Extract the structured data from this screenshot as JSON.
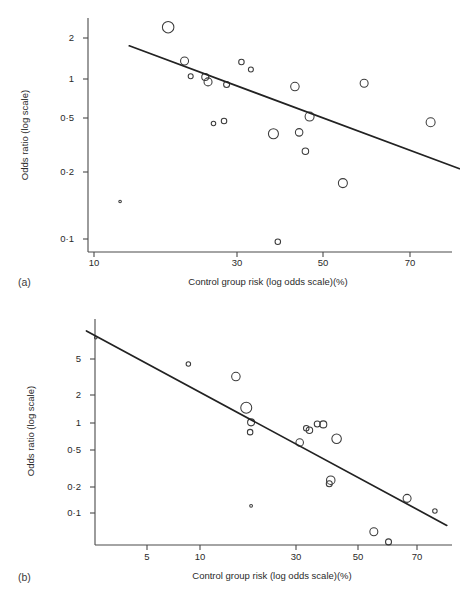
{
  "figure": {
    "panels": [
      {
        "id": "a",
        "label": "(a)",
        "xlabel": "Control group risk (log odds scale)(%)",
        "ylabel": "Odds ratio (log scale)",
        "xticks": [
          "10",
          "30",
          "50",
          "70"
        ],
        "yticks": [
          "2",
          "1",
          "0·5",
          "0·2",
          "0·1"
        ]
      },
      {
        "id": "b",
        "label": "(b)",
        "xlabel": "Control group risk (log odds scale)(%)",
        "ylabel": "Odds ratio (log scale)",
        "xticks": [
          "5",
          "10",
          "30",
          "50",
          "70"
        ],
        "yticks": [
          "5",
          "2",
          "1",
          "0·5",
          "0·2",
          "0·1"
        ]
      }
    ]
  },
  "chart_data": [
    {
      "type": "scatter",
      "panel": "(a)",
      "title": "",
      "xlabel": "Control group risk (log odds scale)(%)",
      "ylabel": "Odds ratio (log scale)",
      "xscale": "log-odds",
      "yscale": "log",
      "xtick_values": [
        10,
        30,
        50,
        70
      ],
      "xtick_labels": [
        "10",
        "30",
        "50",
        "70"
      ],
      "ytick_values": [
        2,
        1,
        0.5,
        0.2,
        0.1
      ],
      "ytick_labels": [
        "2",
        "1",
        "0·5",
        "0·2",
        "0·1"
      ],
      "grid": false,
      "legend": false,
      "marker": "open-circle-size-weighted",
      "points": [
        {
          "x": 18.5,
          "y": 2.35,
          "size": 11.5
        },
        {
          "x": 21.0,
          "y": 1.42,
          "size": 8.0
        },
        {
          "x": 22.0,
          "y": 1.13,
          "size": 5.0
        },
        {
          "x": 24.5,
          "y": 1.12,
          "size": 7.0
        },
        {
          "x": 25.0,
          "y": 1.04,
          "size": 8.0
        },
        {
          "x": 28.5,
          "y": 1.0,
          "size": 6.0
        },
        {
          "x": 31.5,
          "y": 1.4,
          "size": 5.5
        },
        {
          "x": 33.5,
          "y": 1.25,
          "size": 5.0
        },
        {
          "x": 26.0,
          "y": 0.56,
          "size": 4.5
        },
        {
          "x": 28.0,
          "y": 0.58,
          "size": 5.5
        },
        {
          "x": 38.5,
          "y": 0.48,
          "size": 10.0
        },
        {
          "x": 43.5,
          "y": 0.97,
          "size": 8.5
        },
        {
          "x": 44.5,
          "y": 0.49,
          "size": 7.5
        },
        {
          "x": 47.0,
          "y": 0.62,
          "size": 9.0
        },
        {
          "x": 46.0,
          "y": 0.37,
          "size": 6.5
        },
        {
          "x": 55.0,
          "y": 0.23,
          "size": 9.0
        },
        {
          "x": 60.0,
          "y": 1.02,
          "size": 8.0
        },
        {
          "x": 74.0,
          "y": 0.57,
          "size": 9.0
        },
        {
          "x": 39.5,
          "y": 0.096,
          "size": 5.5
        },
        {
          "x": 12.5,
          "y": 0.175,
          "size": 2.6
        }
      ],
      "fit_line": {
        "x1": 13.5,
        "y1": 1.78,
        "x2": 79.0,
        "y2": 0.285
      }
    },
    {
      "type": "scatter",
      "panel": "(b)",
      "title": "",
      "xlabel": "Control group risk (log odds scale)(%)",
      "ylabel": "Odds ratio (log scale)",
      "xscale": "log-odds",
      "yscale": "log",
      "xtick_values": [
        5,
        10,
        30,
        50,
        70
      ],
      "xtick_labels": [
        "5",
        "10",
        "30",
        "50",
        "70"
      ],
      "ytick_values": [
        5,
        2,
        1,
        0.5,
        0.2,
        0.1
      ],
      "ytick_labels": [
        "5",
        "2",
        "1",
        "0·5",
        "0·2",
        "0·1"
      ],
      "grid": false,
      "legend": false,
      "marker": "open-circle-size-weighted",
      "points": [
        {
          "x": 2.5,
          "y": 8.6,
          "size": 2.6
        },
        {
          "x": 8.6,
          "y": 4.4,
          "size": 4.5
        },
        {
          "x": 15.5,
          "y": 3.2,
          "size": 8.5
        },
        {
          "x": 17.5,
          "y": 1.45,
          "size": 11.0
        },
        {
          "x": 18.5,
          "y": 1.0,
          "size": 7.0
        },
        {
          "x": 18.3,
          "y": 0.78,
          "size": 5.5
        },
        {
          "x": 31.0,
          "y": 0.6,
          "size": 7.5
        },
        {
          "x": 33.0,
          "y": 0.86,
          "size": 5.5
        },
        {
          "x": 34.0,
          "y": 0.82,
          "size": 6.5
        },
        {
          "x": 36.5,
          "y": 0.96,
          "size": 6.0
        },
        {
          "x": 38.5,
          "y": 0.95,
          "size": 7.0
        },
        {
          "x": 43.0,
          "y": 0.66,
          "size": 9.5
        },
        {
          "x": 41.0,
          "y": 0.23,
          "size": 8.5
        },
        {
          "x": 40.5,
          "y": 0.21,
          "size": 6.0
        },
        {
          "x": 18.5,
          "y": 0.12,
          "size": 2.8
        },
        {
          "x": 67.0,
          "y": 0.145,
          "size": 8.0
        },
        {
          "x": 75.0,
          "y": 0.105,
          "size": 4.5
        },
        {
          "x": 56.0,
          "y": 0.062,
          "size": 8.0
        },
        {
          "x": 61.0,
          "y": 0.048,
          "size": 6.0
        }
      ],
      "fit_line": {
        "x1": 2.2,
        "y1": 10.2,
        "x2": 78.0,
        "y2": 0.073
      }
    }
  ]
}
